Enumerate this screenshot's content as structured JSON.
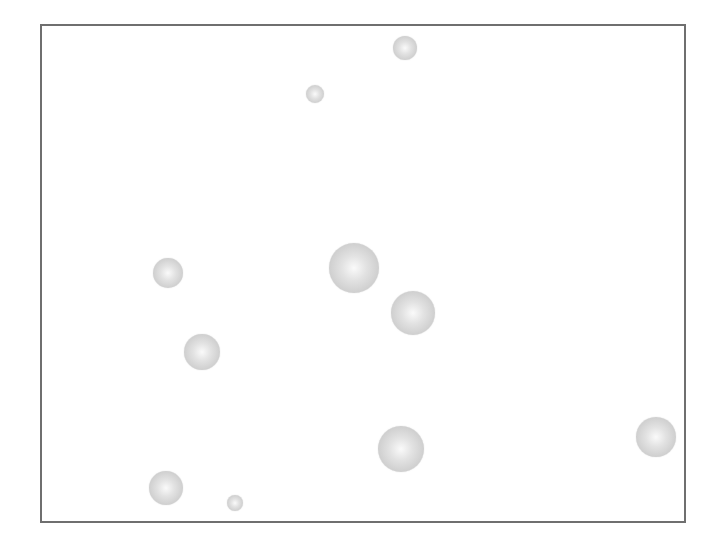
{
  "figure": {
    "frame": {
      "left": 40,
      "top": 24,
      "right": 686,
      "bottom": 523,
      "border_color": "#6f6f6f"
    },
    "sphere_color": "#cfcfcf",
    "spheres": [
      {
        "x": 405,
        "y": 48,
        "r": 12
      },
      {
        "x": 315,
        "y": 94,
        "r": 9
      },
      {
        "x": 168,
        "y": 273,
        "r": 15
      },
      {
        "x": 354,
        "y": 268,
        "r": 25
      },
      {
        "x": 413,
        "y": 313,
        "r": 22
      },
      {
        "x": 202,
        "y": 352,
        "r": 18
      },
      {
        "x": 401,
        "y": 449,
        "r": 23
      },
      {
        "x": 656,
        "y": 437,
        "r": 20
      },
      {
        "x": 166,
        "y": 488,
        "r": 17
      },
      {
        "x": 235,
        "y": 503,
        "r": 8
      }
    ]
  }
}
